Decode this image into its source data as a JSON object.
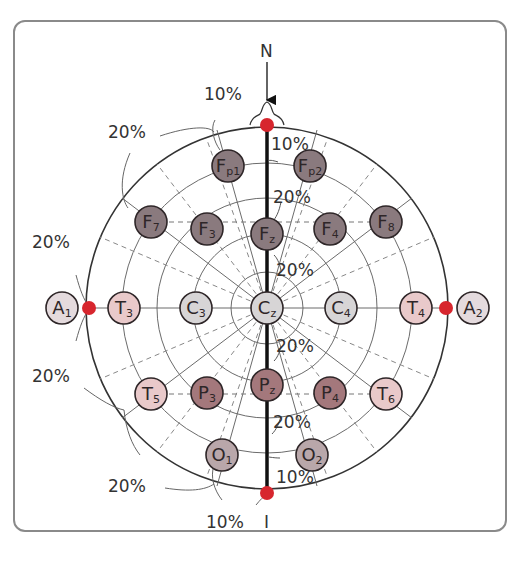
{
  "diagram": {
    "landmarks": {
      "nasion": "N",
      "inion": "I"
    },
    "percent_labels": {
      "top_10": "10%",
      "top_left_20": "20%",
      "left_upper_20": "20%",
      "left_lower_20": "20%",
      "bottom_left_20": "20%",
      "bottom_10": "10%",
      "mid_fp_10": "10%",
      "mid_fz_20": "20%",
      "mid_cz_upper_20": "20%",
      "mid_cz_lower_20": "20%",
      "mid_pz_20": "20%",
      "mid_o_10": "10%"
    },
    "electrodes": [
      {
        "id": "Fp1",
        "main": "F",
        "sub": "p1",
        "x": 228,
        "y": 166,
        "color": "#8a7a7e",
        "group": "frontal"
      },
      {
        "id": "Fp2",
        "main": "F",
        "sub": "p2",
        "x": 310,
        "y": 166,
        "color": "#8a7a7e",
        "group": "frontal"
      },
      {
        "id": "F7",
        "main": "F",
        "sub": "7",
        "x": 151,
        "y": 222,
        "color": "#8a7a7e",
        "group": "frontal"
      },
      {
        "id": "F3",
        "main": "F",
        "sub": "3",
        "x": 207,
        "y": 229,
        "color": "#8a7a7e",
        "group": "frontal"
      },
      {
        "id": "Fz",
        "main": "F",
        "sub": "z",
        "x": 267,
        "y": 234,
        "color": "#8a7a7e",
        "group": "frontal"
      },
      {
        "id": "F4",
        "main": "F",
        "sub": "4",
        "x": 330,
        "y": 229,
        "color": "#8a7a7e",
        "group": "frontal"
      },
      {
        "id": "F8",
        "main": "F",
        "sub": "8",
        "x": 386,
        "y": 222,
        "color": "#8a7a7e",
        "group": "frontal"
      },
      {
        "id": "A1",
        "main": "A",
        "sub": "1",
        "x": 62,
        "y": 308,
        "color": "#e4dadd",
        "group": "auricular"
      },
      {
        "id": "T3",
        "main": "T",
        "sub": "3",
        "x": 124,
        "y": 308,
        "color": "#e9c9ca",
        "group": "temporal"
      },
      {
        "id": "C3",
        "main": "C",
        "sub": "3",
        "x": 196,
        "y": 308,
        "color": "#d7d5d6",
        "group": "central"
      },
      {
        "id": "Cz",
        "main": "C",
        "sub": "z",
        "x": 267,
        "y": 308,
        "color": "#d7d5d6",
        "group": "central"
      },
      {
        "id": "C4",
        "main": "C",
        "sub": "4",
        "x": 341,
        "y": 308,
        "color": "#d7d5d6",
        "group": "central"
      },
      {
        "id": "T4",
        "main": "T",
        "sub": "4",
        "x": 416,
        "y": 308,
        "color": "#e9c9ca",
        "group": "temporal"
      },
      {
        "id": "A2",
        "main": "A",
        "sub": "2",
        "x": 473,
        "y": 308,
        "color": "#e4dadd",
        "group": "auricular"
      },
      {
        "id": "T5",
        "main": "T",
        "sub": "5",
        "x": 151,
        "y": 394,
        "color": "#e9c9ca",
        "group": "temporal"
      },
      {
        "id": "P3",
        "main": "P",
        "sub": "3",
        "x": 207,
        "y": 393,
        "color": "#a4787c",
        "group": "parietal"
      },
      {
        "id": "Pz",
        "main": "P",
        "sub": "z",
        "x": 267,
        "y": 385,
        "color": "#a4787c",
        "group": "parietal"
      },
      {
        "id": "P4",
        "main": "P",
        "sub": "4",
        "x": 330,
        "y": 393,
        "color": "#a4787c",
        "group": "parietal"
      },
      {
        "id": "T6",
        "main": "T",
        "sub": "6",
        "x": 386,
        "y": 394,
        "color": "#e9c9ca",
        "group": "temporal"
      },
      {
        "id": "O1",
        "main": "O",
        "sub": "1",
        "x": 222,
        "y": 455,
        "color": "#b9a7aa",
        "group": "occipital"
      },
      {
        "id": "O2",
        "main": "O",
        "sub": "2",
        "x": 312,
        "y": 455,
        "color": "#b9a7aa",
        "group": "occipital"
      }
    ],
    "reference_points": [
      {
        "id": "nasion-point",
        "x": 267,
        "y": 125
      },
      {
        "id": "inion-point",
        "x": 267,
        "y": 493
      },
      {
        "id": "left-preauricular-point",
        "x": 89,
        "y": 308
      },
      {
        "id": "right-preauricular-point",
        "x": 446,
        "y": 308
      }
    ],
    "colors": {
      "reference_point": "#d7262e",
      "outline": "#333333",
      "grid": "#6b6b6b",
      "midline": "#111111"
    }
  }
}
